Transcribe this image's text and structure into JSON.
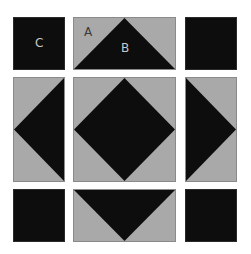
{
  "diagram": {
    "title": "",
    "colors": {
      "dark": "#0d0d0d",
      "light": "#a9a9a9",
      "border": "#8a8a8a"
    },
    "labels": {
      "a": "A",
      "b": "B",
      "c": "C"
    },
    "blocks": [
      {
        "id": "top-left",
        "type": "solid-square"
      },
      {
        "id": "top-middle",
        "type": "flying-geese-up"
      },
      {
        "id": "top-right",
        "type": "solid-square"
      },
      {
        "id": "middle-left",
        "type": "flying-geese-left"
      },
      {
        "id": "center",
        "type": "square-in-square"
      },
      {
        "id": "middle-right",
        "type": "flying-geese-right"
      },
      {
        "id": "bottom-left",
        "type": "solid-square"
      },
      {
        "id": "bottom-middle",
        "type": "flying-geese-down"
      },
      {
        "id": "bottom-right",
        "type": "solid-square"
      }
    ]
  }
}
